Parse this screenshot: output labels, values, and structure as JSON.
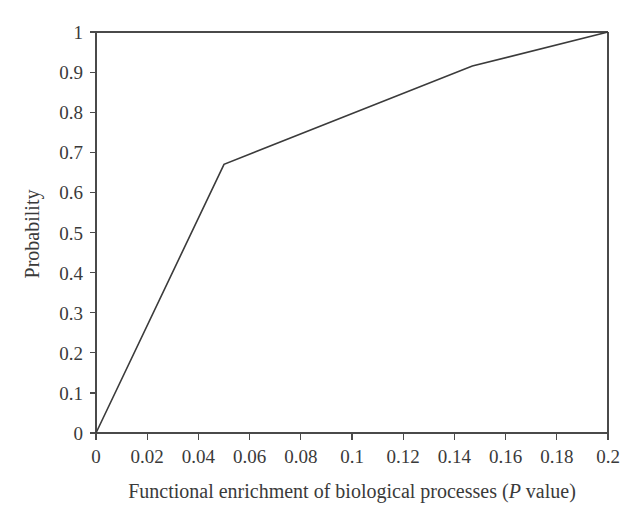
{
  "figure": {
    "background_color": "#ffffff",
    "line_color": "#3b3b3b",
    "axis_color": "#4a4a4a",
    "text_color": "#3a3a3a"
  },
  "axes": {
    "x_title_part1": "Functional enrichment of biological processes (",
    "x_title_italic": "P",
    "x_title_part2": " value)",
    "y_title": "Probability",
    "x_ticks": [
      "0",
      "0.02",
      "0.04",
      "0.06",
      "0.08",
      "0.1",
      "0.12",
      "0.14",
      "0.16",
      "0.18",
      "0.2"
    ],
    "y_ticks": [
      "0",
      "0.1",
      "0.2",
      "0.3",
      "0.4",
      "0.5",
      "0.6",
      "0.7",
      "0.8",
      "0.9",
      "1"
    ]
  },
  "chart_data": {
    "type": "line",
    "title": "",
    "xlabel": "Functional enrichment of biological processes (P value)",
    "ylabel": "Probability",
    "xlim": [
      0,
      0.2
    ],
    "ylim": [
      0,
      1
    ],
    "xticks": [
      0,
      0.02,
      0.04,
      0.06,
      0.08,
      0.1,
      0.12,
      0.14,
      0.16,
      0.18,
      0.2
    ],
    "yticks": [
      0,
      0.1,
      0.2,
      0.3,
      0.4,
      0.5,
      0.6,
      0.7,
      0.8,
      0.9,
      1
    ],
    "grid": false,
    "legend": false,
    "series": [
      {
        "name": "Cumulative probability",
        "x": [
          0,
          0.05,
          0.147,
          0.2
        ],
        "y": [
          0,
          0.67,
          0.915,
          1
        ]
      }
    ]
  }
}
